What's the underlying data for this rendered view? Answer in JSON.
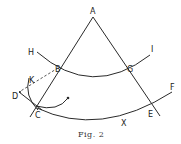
{
  "figure": {
    "caption": "Fig. 2",
    "stroke_color": "#2a2a2a"
  },
  "points": {
    "A": "A",
    "B": "B",
    "C": "C",
    "D": "D",
    "E": "E",
    "F": "F",
    "G": "G",
    "H": "H",
    "I": "I",
    "K": "K",
    "X": "X"
  }
}
